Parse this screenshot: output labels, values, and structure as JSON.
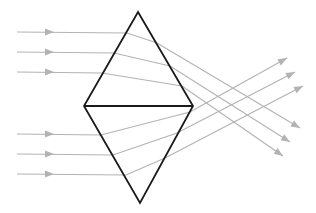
{
  "diagram": {
    "title": "Light rays refracting through a double prism",
    "colors": {
      "background": "#ffffff",
      "prism_stroke": "#1a1a1a",
      "ray_stroke": "#b3b3b3"
    },
    "prism": {
      "top_vertex": [
        138,
        12
      ],
      "left_vertex": [
        84,
        106
      ],
      "right_vertex": [
        193,
        106
      ],
      "bottom_vertex": [
        140,
        203
      ]
    },
    "upper_rays": [
      {
        "start": [
          17,
          32
        ],
        "arrow_mid": [
          50,
          32
        ],
        "enter": [
          127,
          33
        ],
        "exit": [
          157,
          43
        ],
        "end": [
          300,
          128
        ]
      },
      {
        "start": [
          17,
          52
        ],
        "arrow_mid": [
          50,
          52
        ],
        "enter": [
          114,
          53
        ],
        "exit": [
          170,
          66
        ],
        "end": [
          290,
          142
        ]
      },
      {
        "start": [
          17,
          72
        ],
        "arrow_mid": [
          50,
          72
        ],
        "enter": [
          102,
          73
        ],
        "exit": [
          182,
          86
        ],
        "end": [
          283,
          156
        ]
      }
    ],
    "lower_rays": [
      {
        "start": [
          17,
          134
        ],
        "arrow_mid": [
          50,
          134
        ],
        "enter": [
          101,
          135
        ],
        "exit": [
          190,
          112
        ],
        "end": [
          287,
          58
        ]
      },
      {
        "start": [
          17,
          154
        ],
        "arrow_mid": [
          50,
          154
        ],
        "enter": [
          113,
          155
        ],
        "exit": [
          177,
          133
        ],
        "end": [
          295,
          72
        ]
      },
      {
        "start": [
          17,
          174
        ],
        "arrow_mid": [
          50,
          174
        ],
        "enter": [
          126,
          175
        ],
        "exit": [
          165,
          158
        ],
        "end": [
          303,
          86
        ]
      }
    ]
  }
}
